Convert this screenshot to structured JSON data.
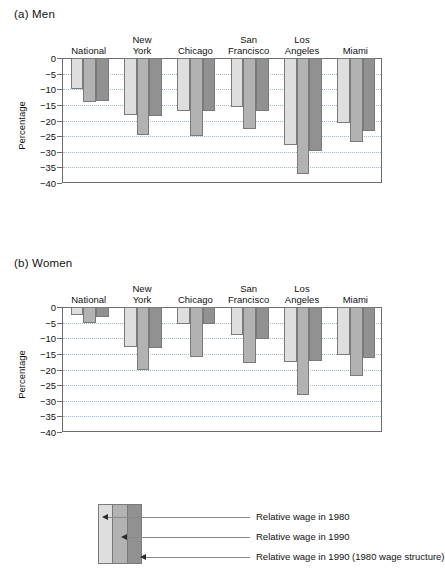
{
  "chart_data": {
    "type": "bar",
    "title": "",
    "ylabel": "Percentage",
    "xlabel": "",
    "ylim": [
      -40,
      0
    ],
    "yticks": [
      0,
      -5,
      -10,
      -15,
      -20,
      -25,
      -30,
      -35,
      -40
    ],
    "ytick_labels": [
      "0",
      "−5",
      "−10",
      "−15",
      "−20",
      "−25",
      "−30",
      "−35",
      "−40"
    ],
    "grid": true,
    "legend_position": "bottom",
    "categories": [
      "National",
      "New York",
      "Chicago",
      "San Francisco",
      "Los Angeles",
      "Miami"
    ],
    "series_names": [
      "Relative wage in 1980",
      "Relative wage in 1990",
      "Relative wage in 1990 (1980 wage structure)"
    ],
    "panels": [
      {
        "id": "a",
        "label": "(a) Men",
        "series": [
          {
            "name": "Relative wage in 1980",
            "values": [
              -10.0,
              -18.2,
              -17.1,
              -15.7,
              -27.9,
              -20.7
            ]
          },
          {
            "name": "Relative wage in 1990",
            "values": [
              -14.1,
              -24.7,
              -24.8,
              -22.7,
              -37.0,
              -26.8
            ]
          },
          {
            "name": "Relative wage in 1990 (1980 wage structure)",
            "values": [
              -13.6,
              -18.4,
              -17.0,
              -17.0,
              -29.7,
              -23.5
            ]
          }
        ]
      },
      {
        "id": "b",
        "label": "(b) Women",
        "series": [
          {
            "name": "Relative wage in 1980",
            "values": [
              -2.4,
              -12.8,
              -5.5,
              -9.1,
              -17.5,
              -15.5
            ]
          },
          {
            "name": "Relative wage in 1990",
            "values": [
              -5.2,
              -20.0,
              -16.0,
              -18.0,
              -28.3,
              -22.2
            ]
          },
          {
            "name": "Relative wage in 1990 (1980 wage structure)",
            "values": [
              -3.3,
              -13.2,
              -5.3,
              -10.1,
              -17.2,
              -16.3
            ]
          }
        ]
      }
    ],
    "colors": {
      "series_1980": "#dedede",
      "series_1990": "#b2b2b2",
      "series_1990_1980struct": "#919191",
      "axis": "#6d6d6d",
      "gridline": "#9fb8c8"
    }
  },
  "legend": {
    "entries": [
      {
        "label": "Relative wage in 1980"
      },
      {
        "label": "Relative wage in 1990"
      },
      {
        "label": "Relative wage in 1990 (1980 wage structure)"
      }
    ]
  }
}
